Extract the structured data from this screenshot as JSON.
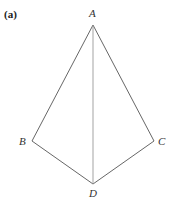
{
  "figure": {
    "label": "(a)"
  },
  "diagram": {
    "type": "kite-quadrilateral",
    "vertices": {
      "A": {
        "label": "A",
        "x": 93,
        "y": 25,
        "label_x": 92,
        "label_y": 17
      },
      "B": {
        "label": "B",
        "x": 32,
        "y": 141,
        "label_x": 22,
        "label_y": 145
      },
      "C": {
        "label": "C",
        "x": 154,
        "y": 141,
        "label_x": 158,
        "label_y": 145
      },
      "D": {
        "label": "D",
        "x": 93,
        "y": 184,
        "label_x": 90,
        "label_y": 197
      }
    },
    "edges": [
      {
        "from": "A",
        "to": "B"
      },
      {
        "from": "A",
        "to": "C"
      },
      {
        "from": "B",
        "to": "D"
      },
      {
        "from": "C",
        "to": "D"
      },
      {
        "from": "A",
        "to": "D",
        "style": "light"
      }
    ],
    "colors": {
      "edge": "#555555",
      "diagonal": "#999999",
      "label": "#333333"
    }
  }
}
